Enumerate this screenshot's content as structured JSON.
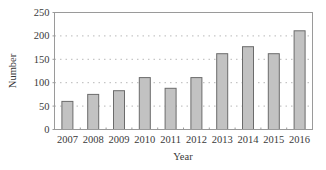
{
  "chart_data": {
    "type": "bar",
    "title": "",
    "xlabel": "Year",
    "ylabel": "Number",
    "categories": [
      "2007",
      "2008",
      "2009",
      "2010",
      "2011",
      "2012",
      "2013",
      "2014",
      "2015",
      "2016"
    ],
    "values": [
      60,
      75,
      83,
      111,
      88,
      111,
      162,
      177,
      162,
      211
    ],
    "ylim": [
      0,
      250
    ],
    "yticks": [
      0,
      50,
      100,
      150,
      200,
      250
    ],
    "grid": {
      "y": true,
      "style": "dotted"
    },
    "legend": null,
    "colors": {
      "bar_fill": "#c2c2c2",
      "bar_stroke": "#6b6b6b",
      "frame": "#9a9a9a",
      "grid": "#b8b8b8",
      "text": "#3a3a3a"
    }
  }
}
